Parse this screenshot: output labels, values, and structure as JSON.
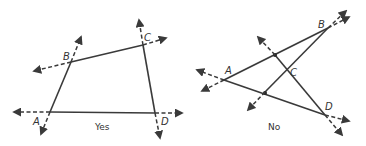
{
  "figures": [
    {
      "caption": "Yes",
      "points": {
        "A": {
          "label": "A",
          "x": 50,
          "y": 112
        },
        "B": {
          "label": "B",
          "x": 71,
          "y": 62
        },
        "C": {
          "label": "C",
          "x": 143,
          "y": 45
        },
        "D": {
          "label": "D",
          "x": 155,
          "y": 113
        }
      }
    },
    {
      "caption": "No",
      "points": {
        "A": {
          "label": "A",
          "x": 224,
          "y": 80
        },
        "B": {
          "label": "B",
          "x": 328,
          "y": 28
        },
        "C": {
          "label": "C",
          "x": 287,
          "y": 70
        },
        "D": {
          "label": "D",
          "x": 325,
          "y": 115
        }
      }
    }
  ]
}
